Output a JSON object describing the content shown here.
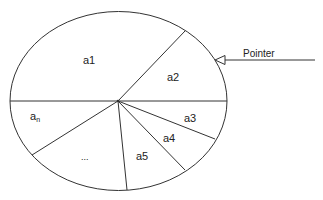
{
  "diagram": {
    "type": "roulette-wheel",
    "segments": [
      {
        "id": "a1",
        "label": "a1"
      },
      {
        "id": "a2",
        "label": "a2"
      },
      {
        "id": "a3",
        "label": "a3"
      },
      {
        "id": "a4",
        "label": "a4"
      },
      {
        "id": "a5",
        "label": "a5"
      },
      {
        "id": "ellipsis",
        "label": "..."
      },
      {
        "id": "an",
        "label": "a",
        "subscript": "n"
      }
    ],
    "pointer": {
      "label": "Pointer"
    }
  },
  "colors": {
    "stroke": "#333333",
    "background": "#ffffff"
  }
}
